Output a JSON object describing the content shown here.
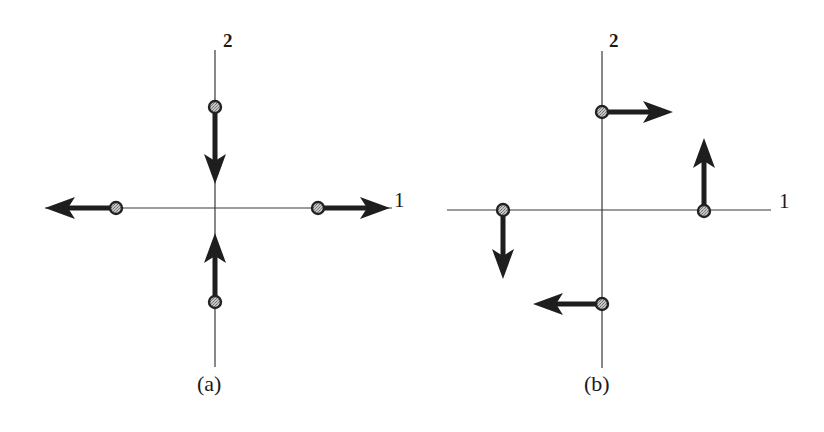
{
  "figure": {
    "panels": [
      {
        "id": "a",
        "caption": "(a)",
        "axis_label_horizontal": "1",
        "axis_label_vertical": "2",
        "origin": [
          215,
          208
        ],
        "atoms": [
          {
            "name": "top",
            "position": [
              215,
              107
            ],
            "arrow_direction": "down",
            "arrow_tip": [
              215,
              184
            ]
          },
          {
            "name": "bottom",
            "position": [
              215,
              302
            ],
            "arrow_direction": "up",
            "arrow_tip": [
              215,
              233
            ]
          },
          {
            "name": "left",
            "position": [
              116,
              208
            ],
            "arrow_direction": "left",
            "arrow_tip": [
              45,
              208
            ]
          },
          {
            "name": "right",
            "position": [
              318,
              208
            ],
            "arrow_direction": "right",
            "arrow_tip": [
              390,
              208
            ]
          }
        ],
        "mode": "breathing (all displacements radial: horizontal atoms move outward, vertical atoms move inward)"
      },
      {
        "id": "b",
        "caption": "(b)",
        "axis_label_horizontal": "1",
        "axis_label_vertical": "2",
        "origin": [
          602,
          210
        ],
        "atoms": [
          {
            "name": "top",
            "position": [
              602,
              112
            ],
            "arrow_direction": "right",
            "arrow_tip": [
              673,
              112
            ]
          },
          {
            "name": "bottom",
            "position": [
              602,
              304
            ],
            "arrow_direction": "left",
            "arrow_tip": [
              533,
              304
            ]
          },
          {
            "name": "left",
            "position": [
              503,
              210
            ],
            "arrow_direction": "down",
            "arrow_tip": [
              503,
              279
            ]
          },
          {
            "name": "right",
            "position": [
              704,
              211
            ],
            "arrow_direction": "up",
            "arrow_tip": [
              704,
              138
            ]
          }
        ],
        "mode": "rotational (all displacements tangential)"
      }
    ],
    "colors": {
      "background": "#ffffff",
      "axis": "#3a3a3a",
      "arrow": "#1e1e1e",
      "atom_ring": "#222222",
      "atom_fill": "#a8a8a8",
      "text": "#1a1a1a"
    }
  }
}
